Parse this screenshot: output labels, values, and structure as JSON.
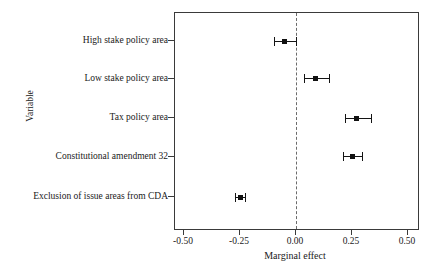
{
  "chart_data": {
    "type": "scatter",
    "title": "",
    "subtitle": "",
    "xlabel": "Marginal effect",
    "ylabel": "Variable",
    "xlim": [
      -0.6,
      0.55
    ],
    "ylim": [
      0,
      5
    ],
    "grid": false,
    "legend": null,
    "orientation": "horizontal",
    "style": "coefficient plot with 95% confidence intervals",
    "reference_line": {
      "value": 0.0,
      "style": "dashed",
      "color": "#6b6b6b"
    },
    "xticks": [
      -0.5,
      -0.25,
      0.0,
      0.25,
      0.5
    ],
    "xtick_labels": [
      "-0.50",
      "-0.25",
      "0.00",
      "0.25",
      "0.50"
    ],
    "categories": [
      "High stake policy area",
      "Low stake policy area",
      "Tax policy area",
      "Constitutional amendment 32",
      "Exclusion of issue areas from CDA"
    ],
    "points": [
      {
        "label": "High stake policy area",
        "estimate": -0.05,
        "ci_low": -0.1,
        "ci_high": 0.0
      },
      {
        "label": "Low stake policy area",
        "estimate": 0.085,
        "ci_low": 0.035,
        "ci_high": 0.147
      },
      {
        "label": "Tax policy area",
        "estimate": 0.272,
        "ci_low": 0.219,
        "ci_high": 0.335
      },
      {
        "label": "Constitutional amendment 32",
        "estimate": 0.25,
        "ci_low": 0.21,
        "ci_high": 0.295
      },
      {
        "label": "Exclusion of issue areas from CDA",
        "estimate": -0.25,
        "ci_low": -0.272,
        "ci_high": -0.228
      }
    ],
    "colors": {
      "point": "#111111",
      "interval": "#141414",
      "axis": "#3a3a3a",
      "reference": "#6b6b6b",
      "background": "#ffffff"
    }
  }
}
